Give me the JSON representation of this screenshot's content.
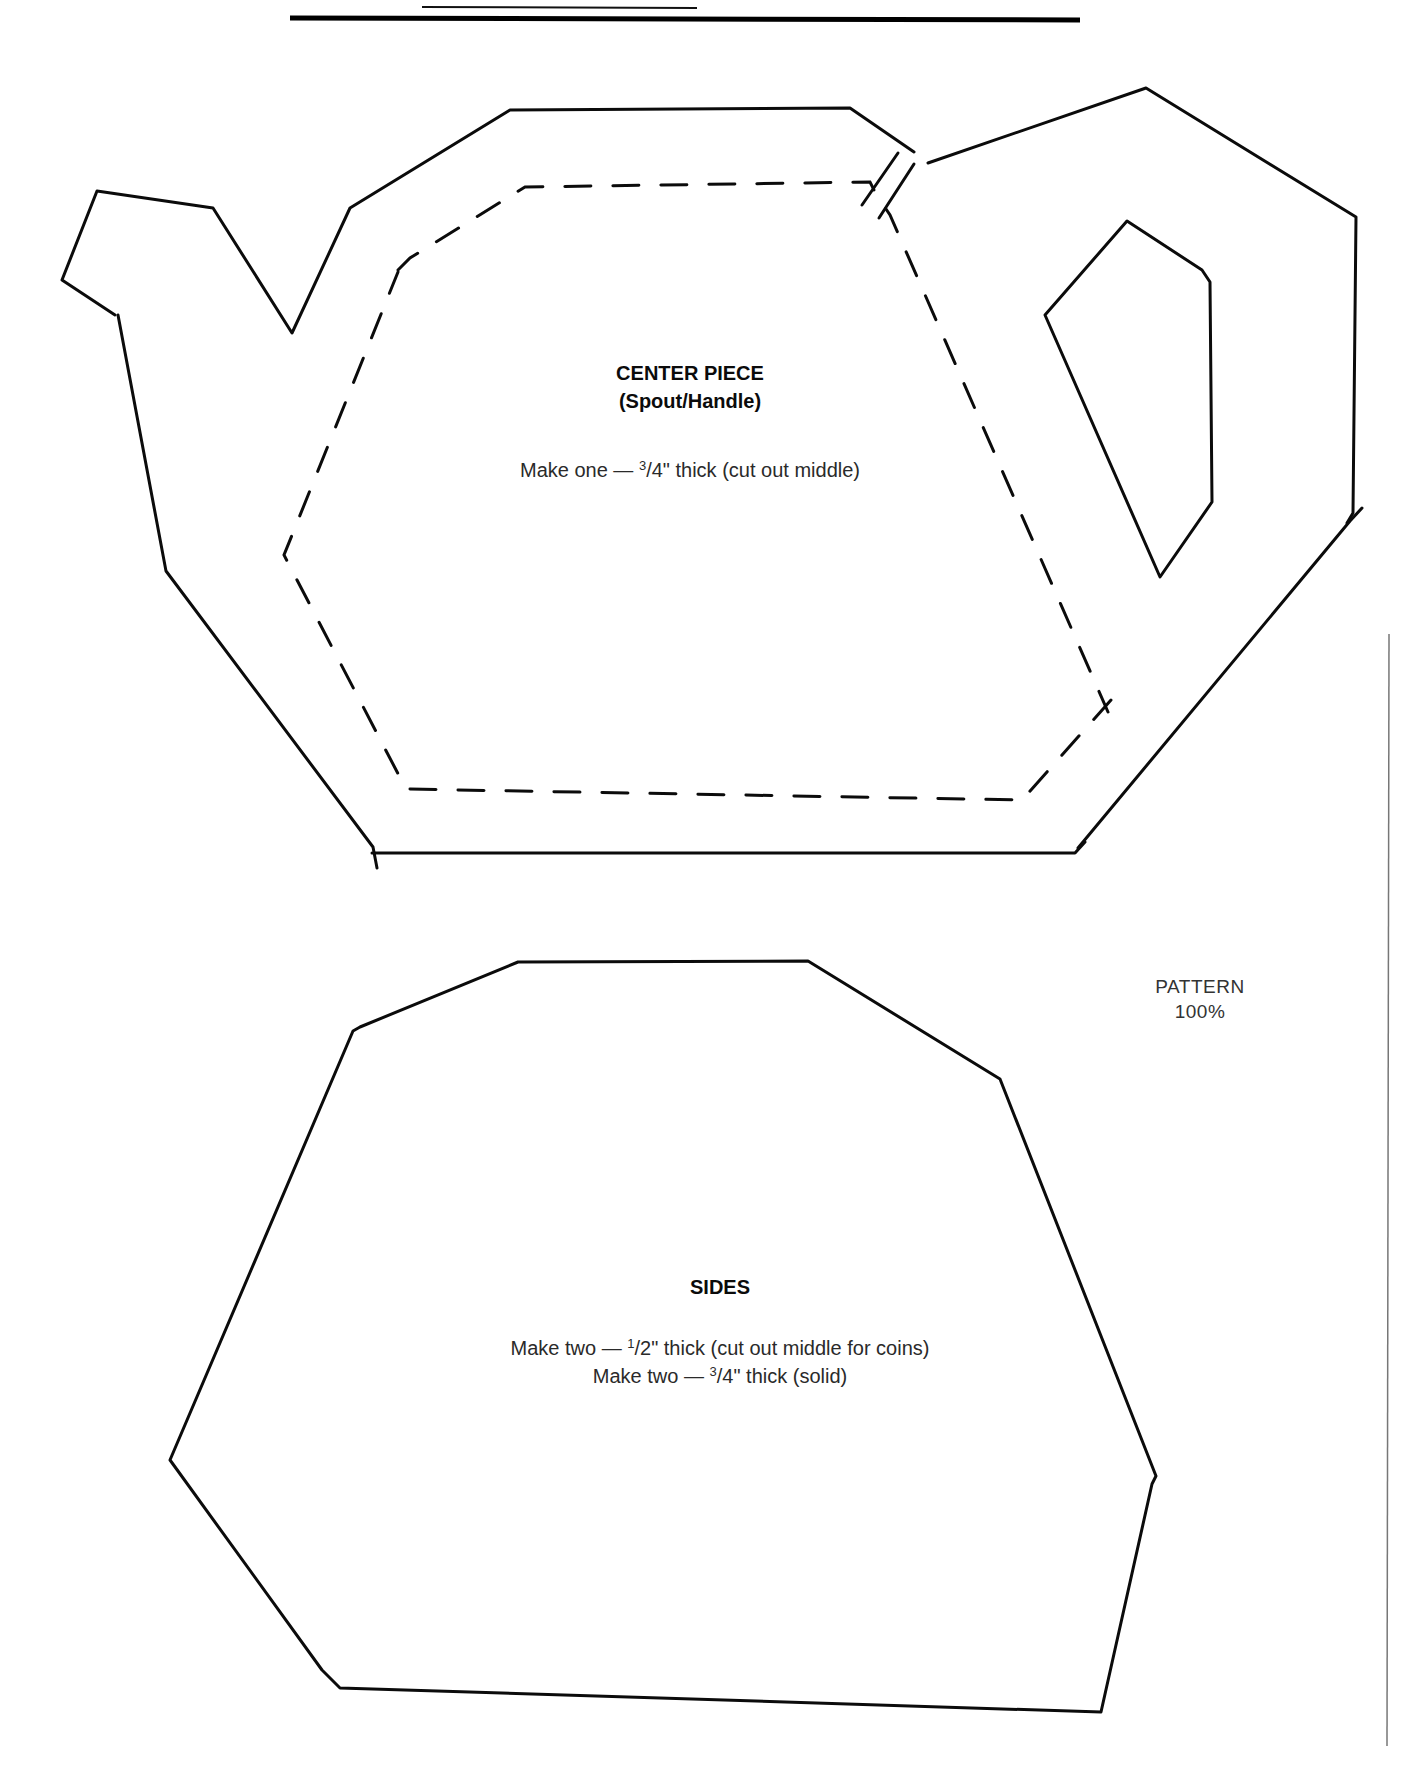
{
  "page": {
    "pattern_label": "PATTERN",
    "pattern_scale": "100%"
  },
  "center_piece": {
    "title": "CENTER PIECE",
    "subtitle": "(Spout/Handle)",
    "instruction_prefix": "Make one — ",
    "instruction_fraction_num": "3",
    "instruction_fraction_rest": "/4\" thick (cut out middle)"
  },
  "sides": {
    "title": "SIDES",
    "line1_prefix": "Make two —  ",
    "line1_fraction_num": "1",
    "line1_fraction_rest": "/2\" thick (cut out middle for coins)",
    "line2_prefix": "Make two — ",
    "line2_fraction_num": "3",
    "line2_fraction_rest": "/4\" thick (solid)"
  },
  "colors": {
    "ink": "#0b0b0b",
    "paper": "#ffffff"
  }
}
